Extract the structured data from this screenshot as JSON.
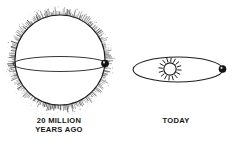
{
  "illustration": {
    "background_color": "#ffffff",
    "ink_color": "#1a1a1a",
    "panels": [
      {
        "id": "past",
        "caption_line1": "20 MILLION",
        "caption_line2": "YEARS AGO",
        "body_label": "expanded-sun",
        "orbit_label": "earth-orbit",
        "planet_label": "earth"
      },
      {
        "id": "today",
        "caption_line1": "TODAY",
        "caption_line2": "",
        "body_label": "sun",
        "orbit_label": "earth-orbit",
        "planet_label": "earth"
      }
    ]
  }
}
